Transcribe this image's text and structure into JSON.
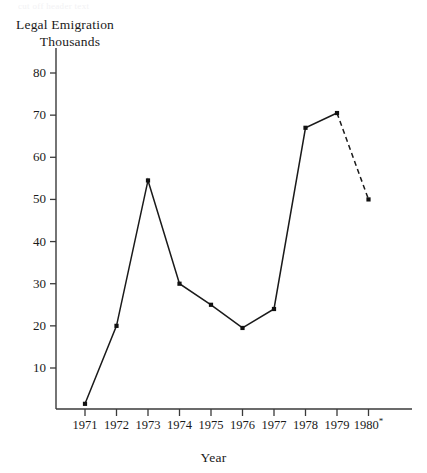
{
  "ghost_text": "cut off header text",
  "axis": {
    "y_title_line1": "Legal Emigration",
    "y_title_line2": "Thousands",
    "x_title": "Year"
  },
  "y_ticks": [
    {
      "label": "80",
      "value": 80
    },
    {
      "label": "70",
      "value": 70
    },
    {
      "label": "60",
      "value": 60
    },
    {
      "label": "50",
      "value": 50
    },
    {
      "label": "40",
      "value": 40
    },
    {
      "label": "30",
      "value": 30
    },
    {
      "label": "20",
      "value": 20
    },
    {
      "label": "10",
      "value": 10
    }
  ],
  "x_ticks": [
    {
      "label": "1971",
      "star": ""
    },
    {
      "label": "1972",
      "star": ""
    },
    {
      "label": "1973",
      "star": ""
    },
    {
      "label": "1974",
      "star": ""
    },
    {
      "label": "1975",
      "star": ""
    },
    {
      "label": "1976",
      "star": ""
    },
    {
      "label": "1977",
      "star": ""
    },
    {
      "label": "1978",
      "star": ""
    },
    {
      "label": "1979",
      "star": ""
    },
    {
      "label": "1980",
      "star": "*"
    }
  ],
  "colors": {
    "line": "#1a1a1a",
    "axis": "#3a3a3a",
    "marker": "#111111",
    "background": "#ffffff"
  },
  "chart_data": {
    "type": "line",
    "title": "",
    "subtitle": "",
    "xlabel": "Year",
    "ylabel": "Legal Emigration Thousands",
    "categories": [
      "1971",
      "1972",
      "1973",
      "1974",
      "1975",
      "1976",
      "1977",
      "1978",
      "1979",
      "1980*"
    ],
    "x": [
      1971,
      1972,
      1973,
      1974,
      1975,
      1976,
      1977,
      1978,
      1979,
      1980
    ],
    "values": [
      1.5,
      20,
      54.5,
      30,
      25,
      19.5,
      24,
      67,
      70.5,
      50
    ],
    "series": [
      {
        "name": "Legal Emigration (Thousands)",
        "values": [
          1.5,
          20,
          54.5,
          30,
          25,
          19.5,
          24,
          67,
          70.5,
          50
        ],
        "style": "solid-with-markers",
        "dashed_from_index": 8
      }
    ],
    "annotations": [
      {
        "text": "*",
        "target": "1980",
        "meaning": "projected / estimated value; final segment drawn dashed"
      }
    ],
    "ylim": [
      0,
      85
    ],
    "ytick_values": [
      10,
      20,
      30,
      40,
      50,
      60,
      70,
      80
    ],
    "xlim": [
      "1971",
      "1980"
    ],
    "grid": false,
    "legend": false,
    "legend_position": "none"
  }
}
